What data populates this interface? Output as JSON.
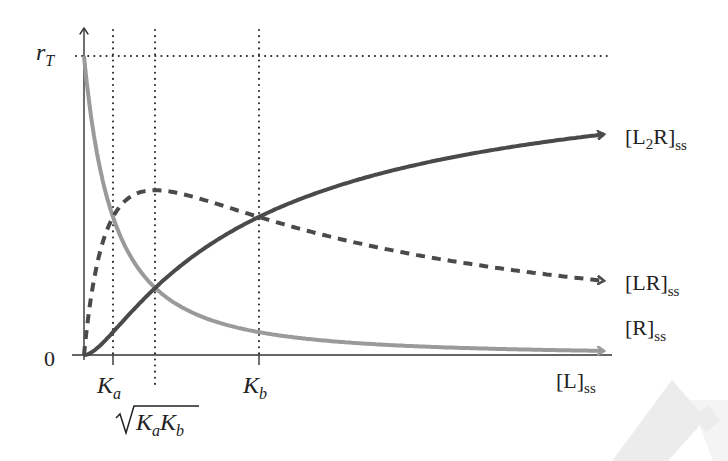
{
  "chart_data": {
    "type": "line",
    "title": "",
    "xlabel": "[L]ss",
    "ylabel": "",
    "x_axis": {
      "label_main": "[L]",
      "label_sub": "ss",
      "ticks": [
        {
          "id": "Ka",
          "label_main": "K",
          "label_sub": "a",
          "x_px": 113
        },
        {
          "id": "sqrtKaKb",
          "label": "√(KaKb)",
          "x_px": 155
        },
        {
          "id": "Kb",
          "label_main": "K",
          "label_sub": "b",
          "x_px": 259
        }
      ]
    },
    "y_axis": {
      "ticks": [
        {
          "label": "0",
          "value": 0
        },
        {
          "label_main": "r",
          "label_sub": "T",
          "value": 1
        }
      ]
    },
    "model": {
      "Ka": 1,
      "Kb": 6.03,
      "rT": 1,
      "x_max": 18
    },
    "series": [
      {
        "name": "[L2R]ss",
        "label_main": "[L",
        "label_sub2": "2",
        "label_tail": "R]",
        "label_sub": "ss",
        "style": "solid",
        "color": "#4a4a4a",
        "end_value": 0.73
      },
      {
        "name": "[LR]ss",
        "label_main": "[LR]",
        "label_sub": "ss",
        "style": "dashed",
        "color": "#4a4a4a",
        "end_value": 0.25,
        "peak_value": 0.56,
        "peak_at": "√(KaKb)"
      },
      {
        "name": "[R]ss",
        "label_main": "[R]",
        "label_sub": "ss",
        "style": "solid",
        "color": "#9a9a9a",
        "end_value": 0.01,
        "start_value": 1
      }
    ],
    "annotations": [
      "[R]ss = [LR]ss at Ka",
      "[R]ss = [L2R]ss at √(KaKb)",
      "[LR]ss = [L2R]ss at Kb"
    ],
    "grid": false,
    "legend": "inline labels at curve ends (right)"
  },
  "colors": {
    "dark": "#4a4a4a",
    "light": "#9a9a9a",
    "axis": "#333333",
    "watermark": "#e8e8e8"
  }
}
